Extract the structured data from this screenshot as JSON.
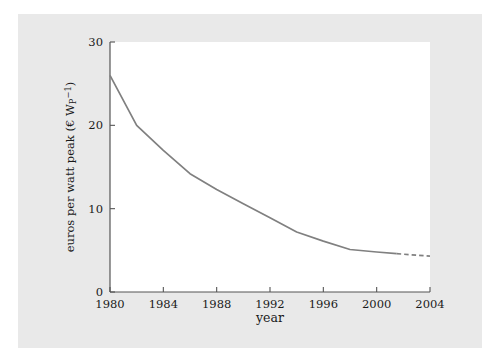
{
  "figure": {
    "background_color": "#e9e9e9",
    "page_color": "#ffffff",
    "plot_background_color": "#ffffff",
    "axis_color": "#555555",
    "text_color": "#1a1a1a",
    "series_color": "#808080"
  },
  "chart_data": {
    "type": "line",
    "title": "",
    "subtitle": "",
    "xlabel": "year",
    "ylabel": "euros per watt peak (€ W",
    "ylabel_sub": "P",
    "ylabel_sup": "−1",
    "ylabel_tail": ")",
    "ylabel_full": "euros per watt peak (€ WP−1)",
    "xlim": [
      1980,
      2004
    ],
    "ylim": [
      0,
      30
    ],
    "xticks": [
      1980,
      1984,
      1988,
      1992,
      1996,
      2000,
      2004
    ],
    "xticklabels": [
      "1980",
      "1984",
      "1988",
      "1992",
      "1996",
      "2000",
      "2004"
    ],
    "yticks": [
      0,
      10,
      20,
      30
    ],
    "yticklabels": [
      "0",
      "10",
      "20",
      "30"
    ],
    "grid": false,
    "legend": null,
    "legend_position": "none",
    "tick_direction": "in",
    "spines": [
      "left",
      "bottom"
    ],
    "series": [
      {
        "name": "module price",
        "style": "solid",
        "color": "#808080",
        "x": [
          1980,
          1982,
          1984,
          1986,
          1988,
          1990,
          1992,
          1994,
          1996,
          1998,
          2000,
          2001.5
        ],
        "y": [
          26.0,
          20.0,
          17.0,
          14.2,
          12.3,
          10.6,
          8.9,
          7.2,
          6.1,
          5.1,
          4.8,
          4.6
        ]
      },
      {
        "name": "module price (projected)",
        "style": "dashed",
        "color": "#808080",
        "x": [
          2001.5,
          2004
        ],
        "y": [
          4.6,
          4.3
        ]
      }
    ]
  }
}
